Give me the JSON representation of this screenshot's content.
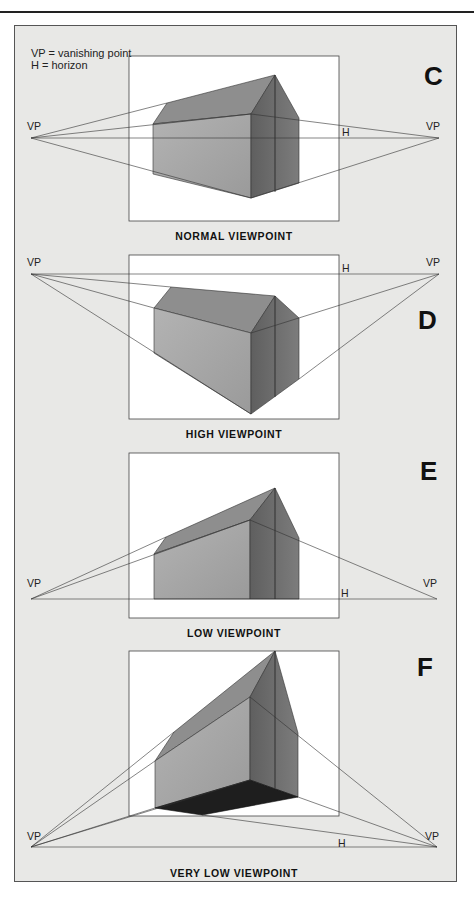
{
  "legend": {
    "line1": "VP = vanishing point",
    "line2": "H = horizon"
  },
  "panels": [
    {
      "letter": "C",
      "caption": "NORMAL VIEWPOINT",
      "vp_left": "VP",
      "vp_right": "VP",
      "horizon": "H"
    },
    {
      "letter": "D",
      "caption": "HIGH VIEWPOINT",
      "vp_left": "VP",
      "vp_right": "VP",
      "horizon": "H"
    },
    {
      "letter": "E",
      "caption": "LOW VIEWPOINT",
      "vp_left": "VP",
      "vp_right": "VP",
      "horizon": "H"
    },
    {
      "letter": "F",
      "caption": "VERY LOW VIEWPOINT",
      "vp_left": "VP",
      "vp_right": "VP",
      "horizon": "H"
    }
  ],
  "colors": {
    "background": "#e8e8e6",
    "frame": "#ffffff",
    "roof": "#8e8e8e",
    "front_wall": "#a9a9a9",
    "side_wall": "#6f6f6f",
    "gable": "#7a7a7a",
    "underside": "#1e1e1e",
    "line": "#333333"
  }
}
